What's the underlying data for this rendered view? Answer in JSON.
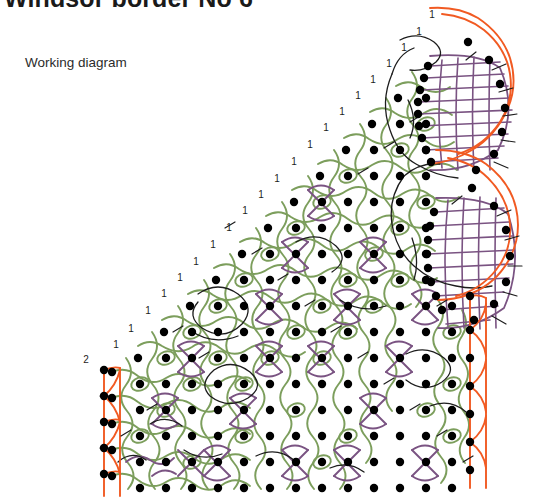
{
  "document": {
    "title": "Windsor border No 6",
    "caption": "Working diagram",
    "background_color": "#ffffff"
  },
  "diagram": {
    "name": "bobbin-lace-working-diagram",
    "type": "technical-thread-path-diagram",
    "colors": {
      "thread_green": "#7c9e5c",
      "thread_purple": "#7a5382",
      "thread_black": "#1d1d1d",
      "edge_orange": "#f15a22",
      "pin_dot": "#000000",
      "text": "#1d1d1d"
    },
    "legend_note": "Green and purple lines are bobbin thread paths; black filled circles are pins; orange lines are the footside and headside edge threads.",
    "footside_label": "2",
    "headside_labels": [
      "1",
      "1",
      "1",
      "1",
      "1",
      "1",
      "1",
      "1",
      "1",
      "1",
      "1",
      "1",
      "1",
      "1",
      "1",
      "1",
      "1",
      "1",
      "1",
      "1",
      "1"
    ],
    "label_diagonal_count": 21,
    "pin_count_approx": 232,
    "fan_count": 2,
    "regions": [
      {
        "name": "footside-edge",
        "position": "left",
        "color": "#f15a22"
      },
      {
        "name": "ground-mesh",
        "position": "center",
        "color": "#7c9e5c"
      },
      {
        "name": "plaited-bars",
        "position": "center",
        "color": "#7a5382"
      },
      {
        "name": "fan-upper",
        "position": "top-right",
        "color": "#7a5382"
      },
      {
        "name": "fan-lower",
        "position": "middle-right",
        "color": "#7a5382"
      },
      {
        "name": "headside-edge",
        "position": "right",
        "color": "#f15a22"
      }
    ]
  }
}
